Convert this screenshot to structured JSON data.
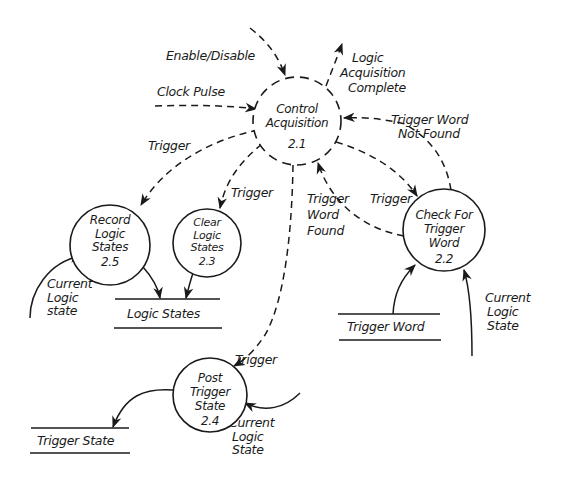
{
  "diagram": {
    "type": "data-flow-diagram",
    "processes": [
      {
        "id": "2.1",
        "name_lines": [
          "Control",
          "Acquisition"
        ],
        "number": "2.1",
        "style": "dashed"
      },
      {
        "id": "2.2",
        "name_lines": [
          "Check For",
          "Trigger",
          "Word"
        ],
        "number": "2.2",
        "style": "solid"
      },
      {
        "id": "2.3",
        "name_lines": [
          "Clear",
          "Logic",
          "States"
        ],
        "number": "2.3",
        "style": "solid"
      },
      {
        "id": "2.4",
        "name_lines": [
          "Post",
          "Trigger",
          "State"
        ],
        "number": "2.4",
        "style": "solid"
      },
      {
        "id": "2.5",
        "name_lines": [
          "Record",
          "Logic",
          "States"
        ],
        "number": "2.5",
        "style": "solid"
      }
    ],
    "stores": [
      {
        "id": "logic-states",
        "label": "Logic States"
      },
      {
        "id": "trigger-word",
        "label": "Trigger Word"
      },
      {
        "id": "trigger-state",
        "label": "Trigger State"
      }
    ],
    "flows": {
      "enable_disable": "Enable/Disable",
      "clock_pulse": "Clock Pulse",
      "logic_acq_complete": [
        "Logic",
        "Acquisition",
        "Complete"
      ],
      "trigger_word_not_found": [
        "Trigger Word",
        "Not Found"
      ],
      "trigger_to_record": "Trigger",
      "trigger_to_clear": "Trigger",
      "trigger_word_found": [
        "Trigger",
        "Word",
        "Found"
      ],
      "trigger_to_check": "Trigger",
      "current_logic_state_record": [
        "Current",
        "Logic",
        "state"
      ],
      "current_logic_state_check": [
        "Current",
        "Logic",
        "State"
      ],
      "trigger_to_post": "Trigger",
      "current_logic_state_post": [
        "Current",
        "Logic",
        "State"
      ]
    },
    "edges": [
      {
        "from": "external",
        "to": "2.1",
        "label": "Enable/Disable",
        "style": "dashed"
      },
      {
        "from": "external",
        "to": "2.1",
        "label": "Clock Pulse",
        "style": "dashed"
      },
      {
        "from": "2.1",
        "to": "external",
        "label": "Logic Acquisition Complete",
        "style": "dashed"
      },
      {
        "from": "2.2",
        "to": "2.1",
        "label": "Trigger Word Not Found",
        "style": "dashed"
      },
      {
        "from": "2.2",
        "to": "2.1",
        "label": "Trigger Word Found",
        "style": "dashed"
      },
      {
        "from": "2.1",
        "to": "2.2",
        "label": "Trigger",
        "style": "dashed"
      },
      {
        "from": "2.1",
        "to": "2.5",
        "label": "Trigger",
        "style": "dashed"
      },
      {
        "from": "2.1",
        "to": "2.3",
        "label": "Trigger",
        "style": "dashed"
      },
      {
        "from": "2.1",
        "to": "2.4",
        "label": "Trigger",
        "style": "dashed"
      },
      {
        "from": "external",
        "to": "2.5",
        "label": "Current Logic state",
        "style": "solid"
      },
      {
        "from": "2.5",
        "to": "Logic States",
        "label": "",
        "style": "solid"
      },
      {
        "from": "2.3",
        "to": "Logic States",
        "label": "",
        "style": "solid"
      },
      {
        "from": "Trigger Word",
        "to": "2.2",
        "label": "",
        "style": "solid"
      },
      {
        "from": "external",
        "to": "2.2",
        "label": "Current Logic State",
        "style": "solid"
      },
      {
        "from": "external",
        "to": "2.4",
        "label": "Current Logic State",
        "style": "solid"
      },
      {
        "from": "2.4",
        "to": "Trigger State",
        "label": "",
        "style": "solid"
      }
    ]
  }
}
